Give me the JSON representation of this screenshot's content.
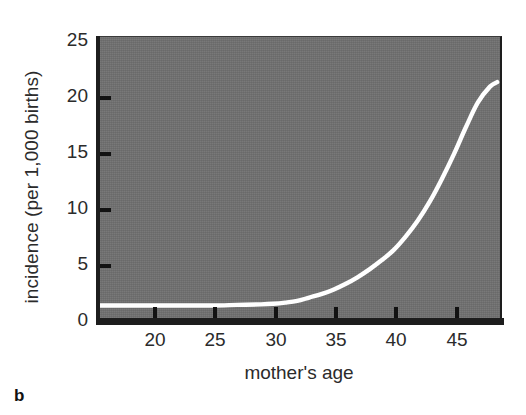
{
  "chart_data": {
    "type": "line",
    "title": "",
    "subtitle": "",
    "panel_label": "b",
    "xlabel": "mother's age",
    "ylabel": "incidence (per 1,000 births)",
    "xlim": [
      15.3,
      49.0
    ],
    "ylim": [
      0,
      25
    ],
    "xticks": [
      20,
      25,
      30,
      35,
      40,
      45
    ],
    "xtick_labels": [
      "20",
      "25",
      "30",
      "35",
      "40",
      "45"
    ],
    "yticks": [
      0,
      5,
      10,
      15,
      20,
      25
    ],
    "ytick_labels": [
      "0",
      "5",
      "10",
      "15",
      "20",
      "25"
    ],
    "grid": false,
    "legend": null,
    "plot_background_color": "#6f6f6f",
    "page_background_color": "#ffffff",
    "axis_color": "#1d1d1d",
    "series": [
      {
        "name": "incidence",
        "color": "#ffffff",
        "line_width": 4,
        "x": [
          15.3,
          17,
          19,
          21,
          23,
          25,
          27,
          29,
          30,
          31,
          32,
          33,
          34,
          35,
          36,
          37,
          38,
          39,
          40,
          41,
          42,
          43,
          44,
          45,
          46,
          47,
          48,
          48.6
        ],
        "y": [
          1.2,
          1.2,
          1.2,
          1.2,
          1.2,
          1.2,
          1.25,
          1.3,
          1.35,
          1.45,
          1.6,
          1.9,
          2.2,
          2.6,
          3.1,
          3.7,
          4.4,
          5.2,
          6.1,
          7.3,
          8.7,
          10.4,
          12.4,
          14.6,
          17.0,
          19.2,
          20.6,
          21.0
        ]
      }
    ],
    "annotations": []
  },
  "axes": {
    "y_title": "incidence (per 1,000 births)",
    "x_title": "mother's age",
    "y_tick_labels": [
      "25",
      "20",
      "15",
      "10",
      "5",
      "0"
    ],
    "x_tick_labels": [
      "20",
      "25",
      "30",
      "35",
      "40",
      "45"
    ]
  },
  "panel": {
    "label": "b"
  }
}
